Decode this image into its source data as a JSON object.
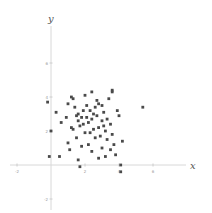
{
  "chart_data": {
    "type": "scatter",
    "title": "",
    "xlabel": "x",
    "ylabel": "y",
    "xlim": [
      -2,
      8
    ],
    "ylim": [
      -2,
      8
    ],
    "grid": false,
    "legend": null,
    "x_ticks": [
      -2,
      2,
      4,
      6
    ],
    "y_ticks": [
      -2,
      2,
      4,
      6
    ],
    "series": [
      {
        "name": "points",
        "color": "#4a4a4a",
        "points": [
          [
            -0.2,
            3.7
          ],
          [
            -0.1,
            0.5
          ],
          [
            0.5,
            0.5
          ],
          [
            0.0,
            2.0
          ],
          [
            0.3,
            3.1
          ],
          [
            0.6,
            2.5
          ],
          [
            1.0,
            3.6
          ],
          [
            1.2,
            4.0
          ],
          [
            1.3,
            3.9
          ],
          [
            1.4,
            3.4
          ],
          [
            1.5,
            2.9
          ],
          [
            1.6,
            2.6
          ],
          [
            1.7,
            2.3
          ],
          [
            1.8,
            2.8
          ],
          [
            1.9,
            3.2
          ],
          [
            2.0,
            4.1
          ],
          [
            2.1,
            3.5
          ],
          [
            2.2,
            2.5
          ],
          [
            2.3,
            1.9
          ],
          [
            2.4,
            2.7
          ],
          [
            2.5,
            3.0
          ],
          [
            2.6,
            3.4
          ],
          [
            2.7,
            3.8
          ],
          [
            2.8,
            2.2
          ],
          [
            2.9,
            1.7
          ],
          [
            3.0,
            2.6
          ],
          [
            3.1,
            3.1
          ],
          [
            3.2,
            2.0
          ],
          [
            3.3,
            1.5
          ],
          [
            3.4,
            3.9
          ],
          [
            3.5,
            2.4
          ],
          [
            3.6,
            4.4
          ],
          [
            3.7,
            1.2
          ],
          [
            3.8,
            0.6
          ],
          [
            3.9,
            3.2
          ],
          [
            4.0,
            2.9
          ],
          [
            4.1,
            0.0
          ],
          [
            4.1,
            -0.4
          ],
          [
            4.2,
            1.4
          ],
          [
            1.0,
            1.3
          ],
          [
            1.1,
            0.9
          ],
          [
            1.5,
            1.6
          ],
          [
            1.6,
            0.3
          ],
          [
            1.7,
            -0.1
          ],
          [
            1.8,
            1.1
          ],
          [
            2.0,
            1.9
          ],
          [
            2.2,
            1.2
          ],
          [
            2.4,
            0.8
          ],
          [
            2.6,
            1.6
          ],
          [
            2.8,
            0.4
          ],
          [
            3.0,
            1.0
          ],
          [
            3.2,
            0.5
          ],
          [
            3.5,
            0.9
          ],
          [
            1.3,
            2.1
          ],
          [
            1.9,
            2.4
          ],
          [
            2.3,
            3.2
          ],
          [
            2.7,
            2.9
          ],
          [
            3.1,
            2.3
          ],
          [
            3.3,
            2.7
          ],
          [
            3.6,
            1.8
          ],
          [
            5.4,
            3.4
          ],
          [
            3.6,
            4.3
          ],
          [
            2.4,
            4.3
          ],
          [
            2.8,
            3.6
          ],
          [
            1.6,
            3.0
          ],
          [
            0.9,
            2.8
          ],
          [
            1.2,
            2.2
          ],
          [
            2.1,
            2.8
          ],
          [
            2.5,
            2.1
          ],
          [
            3.0,
            3.5
          ]
        ]
      }
    ]
  }
}
